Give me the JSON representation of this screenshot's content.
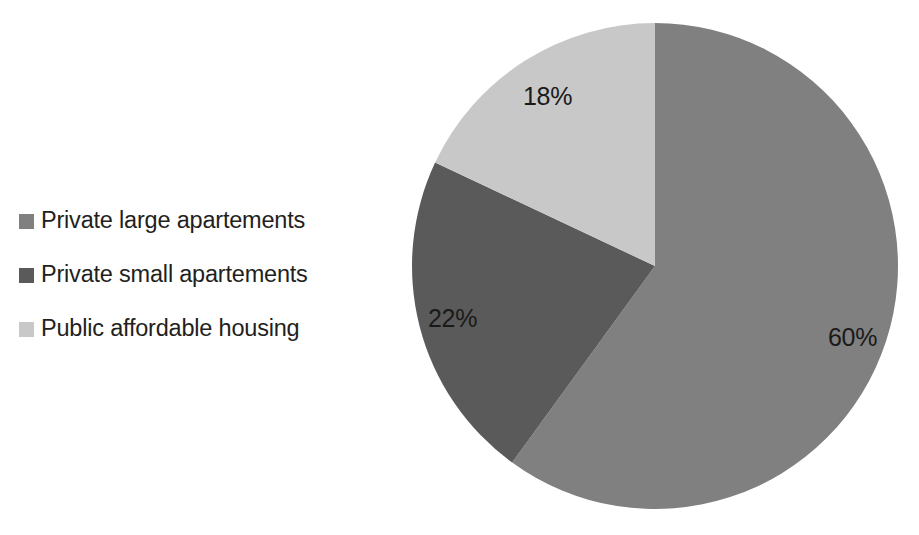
{
  "chart_data": {
    "type": "pie",
    "title": "",
    "subtitle": "",
    "xlabel": "",
    "ylabel": "",
    "grid": false,
    "legend_position": "left",
    "start_angle_deg": 0,
    "direction": "clockwise",
    "categories": [
      "Private large apartements",
      "Private small apartements",
      "Public affordable housing"
    ],
    "values": [
      60,
      22,
      18
    ],
    "value_unit": "%",
    "data_labels": [
      "60%",
      "22%",
      "18%"
    ],
    "colors": [
      "#808080",
      "#5a5a5a",
      "#c8c8c8"
    ],
    "slices": [
      {
        "name": "Private large apartements",
        "value": 60,
        "label": "60%",
        "color": "#808080",
        "start_deg": 0,
        "end_deg": 216
      },
      {
        "name": "Private small apartements",
        "value": 22,
        "label": "22%",
        "color": "#5a5a5a",
        "start_deg": 216,
        "end_deg": 295.2
      },
      {
        "name": "Public affordable housing",
        "value": 18,
        "label": "18%",
        "color": "#c8c8c8",
        "start_deg": 295.2,
        "end_deg": 360
      }
    ]
  },
  "legend": {
    "items": [
      {
        "label": "Private large apartements",
        "color": "#808080"
      },
      {
        "label": "Private small apartements",
        "color": "#5a5a5a"
      },
      {
        "label": "Public affordable housing",
        "color": "#c8c8c8"
      }
    ]
  },
  "labels": {
    "slice_18": "18%",
    "slice_22": "22%",
    "slice_60": "60%"
  },
  "canvas": {
    "background": "#ffffff",
    "text_color": "#231f20",
    "center_x": 655,
    "center_y": 266,
    "radius": 243
  }
}
